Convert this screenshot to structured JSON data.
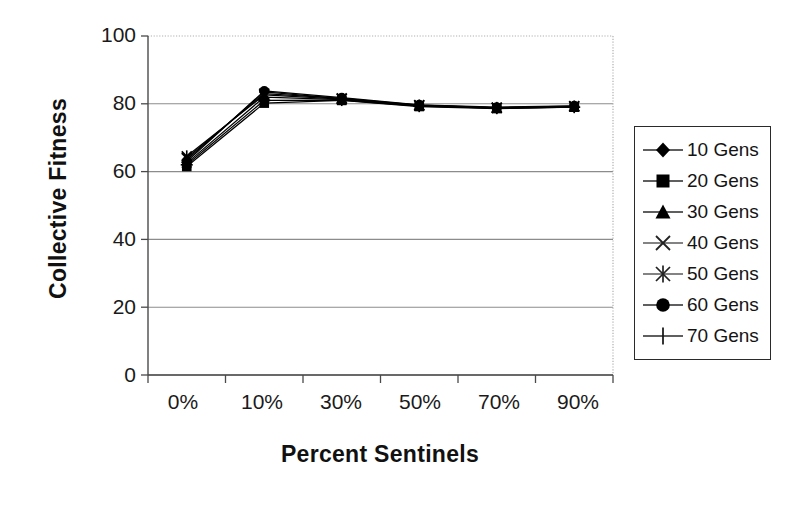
{
  "chart_data": {
    "type": "line",
    "title": "",
    "xlabel": "Percent Sentinels",
    "ylabel": "Collective Fitness",
    "categories": [
      "0%",
      "10%",
      "30%",
      "50%",
      "70%",
      "90%"
    ],
    "ylim": [
      0,
      100
    ],
    "y_ticks": [
      0,
      20,
      40,
      60,
      80,
      100
    ],
    "grid": "horizontal",
    "legend_position": "right",
    "series": [
      {
        "name": "10 Gens",
        "marker": "diamond",
        "values": [
          63.5,
          83.5,
          81.5,
          79.5,
          78.8,
          79.2
        ]
      },
      {
        "name": "20 Gens",
        "marker": "square",
        "values": [
          61.5,
          80.2,
          81.0,
          79.2,
          78.6,
          79.0
        ]
      },
      {
        "name": "30 Gens",
        "marker": "triangle",
        "values": [
          62.5,
          82.0,
          81.2,
          79.4,
          78.7,
          79.1
        ]
      },
      {
        "name": "40 Gens",
        "marker": "x",
        "values": [
          64.0,
          83.0,
          81.6,
          79.6,
          78.9,
          79.3
        ]
      },
      {
        "name": "50 Gens",
        "marker": "asterisk",
        "values": [
          64.5,
          82.6,
          81.4,
          79.5,
          78.8,
          79.2
        ]
      },
      {
        "name": "60 Gens",
        "marker": "circle",
        "values": [
          63.0,
          83.8,
          81.8,
          79.7,
          79.0,
          79.4
        ]
      },
      {
        "name": "70 Gens",
        "marker": "plus",
        "values": [
          62.0,
          81.0,
          81.1,
          79.3,
          78.7,
          79.0
        ]
      }
    ]
  },
  "axes": {
    "y_tick_labels": [
      "100",
      "80",
      "60",
      "40",
      "20",
      "0"
    ],
    "x_tick_labels": [
      "0%",
      "10%",
      "30%",
      "50%",
      "70%",
      "90%"
    ],
    "y_title": "Collective Fitness",
    "x_title": "Percent Sentinels"
  },
  "legend": {
    "items": [
      {
        "label": "10 Gens"
      },
      {
        "label": "20 Gens"
      },
      {
        "label": "30 Gens"
      },
      {
        "label": "40 Gens"
      },
      {
        "label": "50 Gens"
      },
      {
        "label": "60 Gens"
      },
      {
        "label": "70 Gens"
      }
    ]
  },
  "colors": {
    "series": "#000000",
    "gridline": "#8c8c8c",
    "axis": "#4a4a4a",
    "border_dotted": "#b0b0b0",
    "background": "#ffffff",
    "text": "#1a1a1a"
  }
}
